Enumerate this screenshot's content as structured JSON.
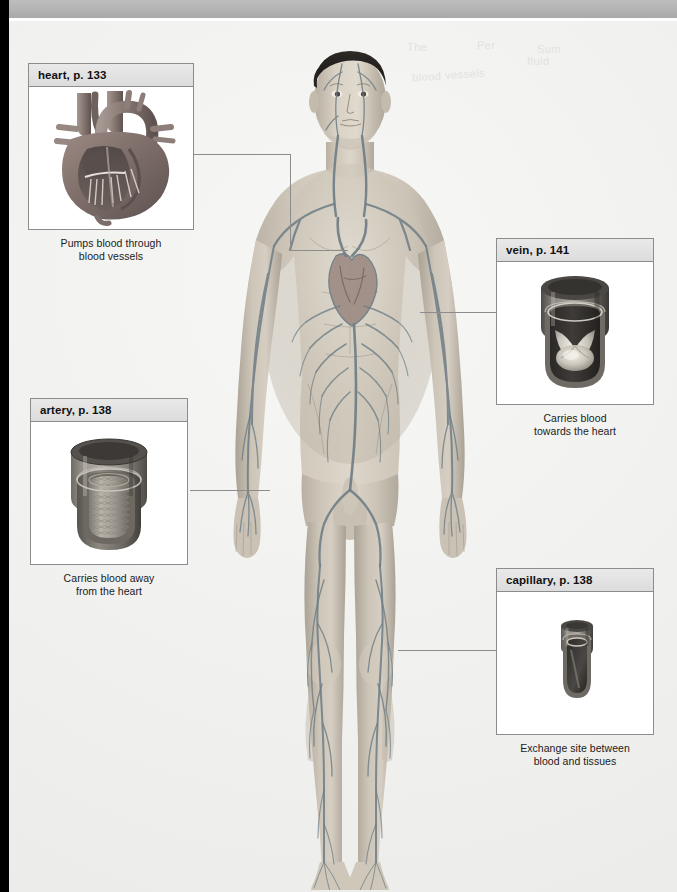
{
  "page": {
    "background_color": "#f3f3f1",
    "top_bar_color": "#b9b9b9",
    "edge_color": "#000000",
    "ghost_watermarks": [
      "The",
      "Per",
      "Sum",
      "fluid",
      "blood vessels"
    ]
  },
  "diagram": {
    "figure_label": "anterior view of human body showing heart, arteries and veins"
  },
  "callouts": [
    {
      "id": "heart",
      "title": "heart, p. 133",
      "caption_line1": "Pumps blood through",
      "caption_line2": "blood vessels",
      "art": "heart-cutaway-illustration",
      "position": "top-left"
    },
    {
      "id": "vein",
      "title": "vein, p. 141",
      "caption_line1": "Carries blood",
      "caption_line2": "towards the heart",
      "art": "vein-cutaway-illustration",
      "position": "middle-right"
    },
    {
      "id": "artery",
      "title": "artery, p. 138",
      "caption_line1": "Carries blood away",
      "caption_line2": "from the heart",
      "art": "artery-cutaway-illustration",
      "position": "middle-left"
    },
    {
      "id": "capillary",
      "title": "capillary, p. 138",
      "caption_line1": "Exchange site between",
      "caption_line2": "blood and tissues",
      "art": "capillary-cutaway-illustration",
      "position": "bottom-right"
    }
  ],
  "colors": {
    "border": "#8c8c8c",
    "title_bar": "#e0e0e0",
    "text": "#111111",
    "vessel_dark": "#5d6b72",
    "skin": "#cfc6b8"
  }
}
